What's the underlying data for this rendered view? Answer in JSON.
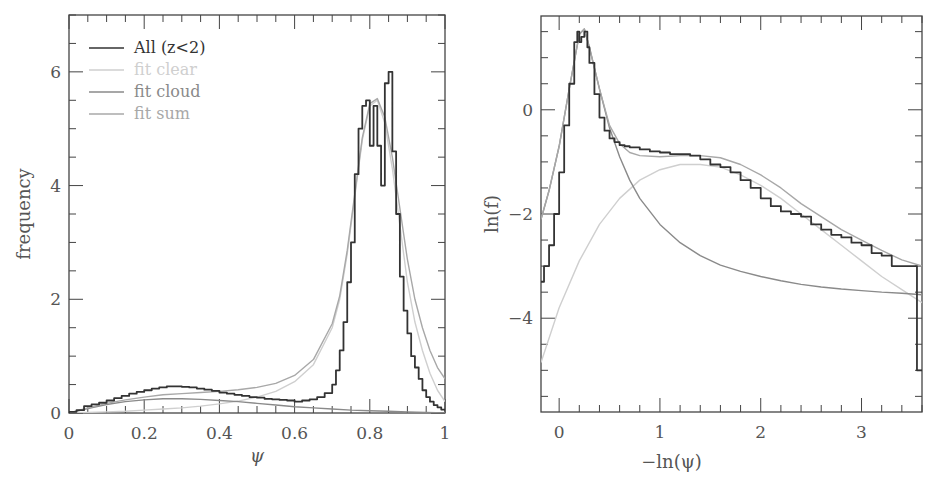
{
  "chart_data": [
    {
      "type": "line",
      "panel": "left",
      "title": "",
      "xlabel": "ψ",
      "ylabel": "frequency",
      "xlim": [
        0,
        1
      ],
      "ylim": [
        0,
        7
      ],
      "xticks": [
        0,
        0.2,
        0.4,
        0.6,
        0.8,
        1
      ],
      "xtick_labels": [
        "0",
        "0.2",
        "0.4",
        "0.6",
        "0.8",
        "1"
      ],
      "yticks": [
        0,
        2,
        4,
        6
      ],
      "ytick_labels": [
        "0",
        "2",
        "4",
        "6"
      ],
      "grid": false,
      "legend_position": "top-left",
      "legend": [
        {
          "label": "All (z<2)",
          "color": "#333333"
        },
        {
          "label": "fit clear",
          "color": "#cfcfcf"
        },
        {
          "label": "fit cloud",
          "color": "#8a8a8a"
        },
        {
          "label": "fit sum",
          "color": "#a8a8a8"
        }
      ],
      "series": [
        {
          "name": "All (z<2)",
          "style": "step",
          "color": "#333333",
          "x": [
            0.0,
            0.02,
            0.04,
            0.06,
            0.08,
            0.1,
            0.12,
            0.14,
            0.16,
            0.18,
            0.2,
            0.22,
            0.24,
            0.26,
            0.28,
            0.3,
            0.32,
            0.34,
            0.36,
            0.38,
            0.4,
            0.42,
            0.44,
            0.46,
            0.48,
            0.5,
            0.52,
            0.54,
            0.56,
            0.58,
            0.6,
            0.62,
            0.64,
            0.66,
            0.68,
            0.7,
            0.71,
            0.72,
            0.73,
            0.74,
            0.75,
            0.76,
            0.77,
            0.78,
            0.79,
            0.8,
            0.81,
            0.82,
            0.83,
            0.84,
            0.85,
            0.86,
            0.87,
            0.88,
            0.89,
            0.9,
            0.91,
            0.92,
            0.93,
            0.94,
            0.95,
            0.96,
            0.97,
            0.98,
            0.99,
            1.0
          ],
          "y": [
            0.02,
            0.05,
            0.12,
            0.15,
            0.18,
            0.22,
            0.26,
            0.3,
            0.34,
            0.37,
            0.4,
            0.43,
            0.45,
            0.47,
            0.47,
            0.46,
            0.45,
            0.43,
            0.41,
            0.39,
            0.36,
            0.34,
            0.32,
            0.3,
            0.28,
            0.27,
            0.25,
            0.24,
            0.23,
            0.22,
            0.2,
            0.22,
            0.24,
            0.28,
            0.35,
            0.5,
            0.75,
            1.1,
            1.6,
            2.3,
            3.0,
            4.2,
            5.0,
            5.4,
            5.5,
            4.7,
            5.4,
            4.7,
            4.0,
            5.8,
            6.0,
            4.6,
            3.5,
            2.4,
            1.8,
            1.4,
            1.0,
            0.8,
            0.6,
            0.4,
            0.28,
            0.2,
            0.14,
            0.1,
            0.06,
            0.04
          ]
        },
        {
          "name": "fit clear",
          "style": "line",
          "color": "#cfcfcf",
          "x": [
            0.0,
            0.05,
            0.1,
            0.15,
            0.2,
            0.25,
            0.3,
            0.35,
            0.4,
            0.45,
            0.5,
            0.55,
            0.6,
            0.65,
            0.7,
            0.72,
            0.74,
            0.76,
            0.78,
            0.8,
            0.82,
            0.84,
            0.86,
            0.88,
            0.9,
            0.92,
            0.94,
            0.96,
            0.98,
            1.0
          ],
          "y": [
            0.0,
            0.01,
            0.02,
            0.03,
            0.05,
            0.07,
            0.09,
            0.12,
            0.16,
            0.21,
            0.28,
            0.38,
            0.55,
            0.85,
            1.5,
            2.0,
            2.8,
            3.8,
            4.8,
            5.4,
            5.5,
            5.1,
            4.3,
            3.3,
            2.3,
            1.6,
            1.1,
            0.7,
            0.4,
            0.2
          ]
        },
        {
          "name": "fit cloud",
          "style": "line",
          "color": "#8a8a8a",
          "x": [
            0.0,
            0.05,
            0.1,
            0.15,
            0.2,
            0.25,
            0.3,
            0.35,
            0.4,
            0.45,
            0.5,
            0.55,
            0.6,
            0.65,
            0.7,
            0.75,
            0.8,
            0.85,
            0.9,
            0.95,
            1.0
          ],
          "y": [
            0.0,
            0.08,
            0.15,
            0.2,
            0.23,
            0.25,
            0.25,
            0.24,
            0.22,
            0.2,
            0.17,
            0.14,
            0.11,
            0.09,
            0.07,
            0.05,
            0.04,
            0.03,
            0.02,
            0.01,
            0.0
          ]
        },
        {
          "name": "fit sum",
          "style": "line",
          "color": "#a8a8a8",
          "x": [
            0.0,
            0.05,
            0.1,
            0.15,
            0.2,
            0.25,
            0.3,
            0.35,
            0.4,
            0.45,
            0.5,
            0.55,
            0.6,
            0.65,
            0.7,
            0.72,
            0.74,
            0.76,
            0.78,
            0.8,
            0.82,
            0.84,
            0.86,
            0.88,
            0.9,
            0.92,
            0.94,
            0.96,
            0.98,
            1.0
          ],
          "y": [
            0.0,
            0.09,
            0.17,
            0.23,
            0.28,
            0.32,
            0.34,
            0.36,
            0.38,
            0.41,
            0.45,
            0.52,
            0.66,
            0.94,
            1.57,
            2.06,
            2.86,
            3.85,
            4.84,
            5.44,
            5.53,
            5.2,
            4.5,
            3.6,
            2.7,
            2.0,
            1.5,
            1.1,
            0.8,
            0.6
          ]
        }
      ]
    },
    {
      "type": "line",
      "panel": "right",
      "title": "",
      "xlabel": "−ln(ψ)",
      "ylabel": "ln(f)",
      "xlim": [
        -0.18,
        3.6
      ],
      "ylim": [
        -5.8,
        1.8
      ],
      "xticks": [
        0,
        1,
        2,
        3
      ],
      "xtick_labels": [
        "0",
        "1",
        "2",
        "3"
      ],
      "yticks": [
        0,
        -2,
        -4
      ],
      "ytick_labels": [
        "0",
        "−2",
        "−4"
      ],
      "grid": false,
      "series": [
        {
          "name": "All (z<2)",
          "style": "step",
          "color": "#333333",
          "x": [
            -0.18,
            -0.15,
            -0.1,
            -0.05,
            0.0,
            0.05,
            0.1,
            0.15,
            0.18,
            0.2,
            0.22,
            0.25,
            0.28,
            0.3,
            0.35,
            0.4,
            0.45,
            0.5,
            0.55,
            0.6,
            0.65,
            0.7,
            0.8,
            0.9,
            1.0,
            1.1,
            1.2,
            1.3,
            1.4,
            1.5,
            1.6,
            1.7,
            1.8,
            1.9,
            2.0,
            2.1,
            2.2,
            2.3,
            2.4,
            2.5,
            2.6,
            2.7,
            2.8,
            2.9,
            3.0,
            3.1,
            3.2,
            3.3,
            3.4,
            3.5,
            3.55,
            3.6
          ],
          "y": [
            -3.3,
            -3.0,
            -2.6,
            -2.0,
            -1.2,
            -0.3,
            0.5,
            1.3,
            1.5,
            1.3,
            1.4,
            1.5,
            1.2,
            0.9,
            0.3,
            -0.15,
            -0.4,
            -0.55,
            -0.62,
            -0.68,
            -0.7,
            -0.72,
            -0.76,
            -0.8,
            -0.82,
            -0.85,
            -0.85,
            -0.88,
            -0.95,
            -1.05,
            -1.1,
            -1.2,
            -1.35,
            -1.5,
            -1.7,
            -1.85,
            -1.95,
            -2.0,
            -2.05,
            -2.2,
            -2.3,
            -2.4,
            -2.45,
            -2.55,
            -2.6,
            -2.75,
            -2.8,
            -3.0,
            -3.0,
            -3.0,
            -5.0,
            -5.0
          ]
        },
        {
          "name": "fit clear",
          "style": "line",
          "color": "#cfcfcf",
          "x": [
            -0.18,
            0.0,
            0.2,
            0.4,
            0.6,
            0.8,
            1.0,
            1.2,
            1.4,
            1.6,
            1.8,
            2.0,
            2.2,
            2.4,
            2.6,
            2.8,
            3.0,
            3.2,
            3.4,
            3.6
          ],
          "y": [
            -4.85,
            -3.8,
            -2.9,
            -2.2,
            -1.7,
            -1.35,
            -1.15,
            -1.05,
            -1.05,
            -1.1,
            -1.25,
            -1.45,
            -1.7,
            -2.0,
            -2.3,
            -2.6,
            -2.9,
            -3.2,
            -3.45,
            -3.7
          ]
        },
        {
          "name": "fit cloud",
          "style": "line",
          "color": "#8a8a8a",
          "x": [
            -0.18,
            -0.1,
            0.0,
            0.1,
            0.2,
            0.25,
            0.3,
            0.4,
            0.5,
            0.6,
            0.7,
            0.8,
            1.0,
            1.2,
            1.4,
            1.6,
            1.8,
            2.0,
            2.2,
            2.4,
            2.6,
            2.8,
            3.0,
            3.2,
            3.4,
            3.6
          ],
          "y": [
            -2.1,
            -1.55,
            -0.7,
            0.4,
            1.45,
            1.55,
            1.2,
            0.4,
            -0.35,
            -0.9,
            -1.35,
            -1.7,
            -2.2,
            -2.55,
            -2.8,
            -2.98,
            -3.1,
            -3.2,
            -3.28,
            -3.35,
            -3.4,
            -3.44,
            -3.47,
            -3.5,
            -3.52,
            -3.55
          ]
        },
        {
          "name": "fit sum",
          "style": "line",
          "color": "#a8a8a8",
          "x": [
            -0.18,
            -0.1,
            0.0,
            0.1,
            0.2,
            0.25,
            0.3,
            0.4,
            0.5,
            0.6,
            0.7,
            0.8,
            1.0,
            1.2,
            1.4,
            1.6,
            1.8,
            2.0,
            2.2,
            2.4,
            2.6,
            2.8,
            3.0,
            3.2,
            3.4,
            3.6
          ],
          "y": [
            -2.1,
            -1.55,
            -0.7,
            0.4,
            1.45,
            1.55,
            1.2,
            0.4,
            -0.3,
            -0.65,
            -0.82,
            -0.88,
            -0.9,
            -0.88,
            -0.88,
            -0.92,
            -1.05,
            -1.25,
            -1.5,
            -1.8,
            -2.05,
            -2.3,
            -2.5,
            -2.7,
            -2.88,
            -3.0
          ]
        }
      ]
    }
  ]
}
